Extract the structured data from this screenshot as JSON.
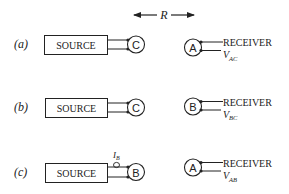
{
  "distance": {
    "label": "R"
  },
  "rows": [
    {
      "label": "(a)",
      "source_label": "SOURCE",
      "source_terminal": "C",
      "receiver_terminal": "A",
      "receiver_label": "RECEIVER",
      "voltage_main": "V",
      "voltage_sub": "AC",
      "current_probe": null
    },
    {
      "label": "(b)",
      "source_label": "SOURCE",
      "source_terminal": "C",
      "receiver_terminal": "B",
      "receiver_label": "RECEIVER",
      "voltage_main": "V",
      "voltage_sub": "BC",
      "current_probe": null
    },
    {
      "label": "(c)",
      "source_label": "SOURCE",
      "source_terminal": "B",
      "receiver_terminal": "A",
      "receiver_label": "RECEIVER",
      "voltage_main": "V",
      "voltage_sub": "AB",
      "current_probe": {
        "main": "I",
        "sub": "B"
      }
    }
  ]
}
